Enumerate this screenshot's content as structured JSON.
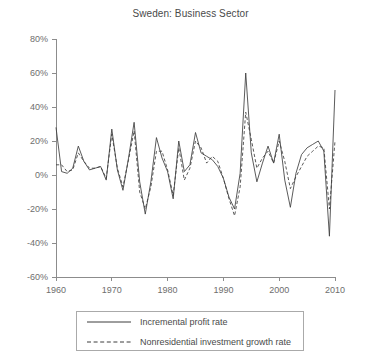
{
  "chart_data": {
    "type": "line",
    "title": "Sweden: Business Sector",
    "xlabel": "",
    "ylabel": "",
    "xlim": [
      1960,
      2010
    ],
    "ylim": [
      -60,
      80
    ],
    "xticks": [
      1960,
      1970,
      1980,
      1990,
      2000,
      2010
    ],
    "xtick_labels": [
      "1960",
      "1970",
      "1980",
      "1990",
      "2000",
      "2010"
    ],
    "yticks": [
      -60,
      -40,
      -20,
      0,
      20,
      40,
      60,
      80
    ],
    "ytick_labels": [
      "-60%",
      "-40%",
      "-20%",
      "0%",
      "20%",
      "40%",
      "60%",
      "80%"
    ],
    "grid": false,
    "legend_position": "below-center",
    "x": [
      1960,
      1961,
      1962,
      1963,
      1964,
      1965,
      1966,
      1967,
      1968,
      1969,
      1970,
      1971,
      1972,
      1973,
      1974,
      1975,
      1976,
      1977,
      1978,
      1979,
      1980,
      1981,
      1982,
      1983,
      1984,
      1985,
      1986,
      1987,
      1988,
      1989,
      1990,
      1991,
      1992,
      1993,
      1994,
      1995,
      1996,
      1997,
      1998,
      1999,
      2000,
      2001,
      2002,
      2003,
      2004,
      2005,
      2006,
      2007,
      2008,
      2009,
      2010
    ],
    "series": [
      {
        "name": "Incremental profit rate",
        "style": "solid",
        "values": [
          28,
          2,
          1,
          4,
          17,
          8,
          3,
          4,
          5,
          -3,
          27,
          3,
          -9,
          10,
          31,
          -4,
          -23,
          -4,
          22,
          10,
          2,
          -14,
          20,
          2,
          6,
          25,
          13,
          11,
          9,
          5,
          -2,
          -13,
          -20,
          1,
          60,
          13,
          -4,
          7,
          17,
          7,
          24,
          -3,
          -19,
          1,
          12,
          16,
          18,
          20,
          14,
          -36,
          50
        ]
      },
      {
        "name": "Nonresidential investment growth rate",
        "style": "dashed",
        "values": [
          6,
          6,
          2,
          3,
          13,
          8,
          4,
          4,
          5,
          -2,
          24,
          4,
          -7,
          9,
          26,
          -10,
          -20,
          -7,
          14,
          14,
          3,
          -12,
          16,
          -3,
          4,
          20,
          16,
          7,
          11,
          8,
          -2,
          -14,
          -24,
          -7,
          37,
          21,
          4,
          10,
          14,
          7,
          20,
          8,
          -8,
          -1,
          5,
          11,
          14,
          17,
          16,
          -20,
          20
        ]
      }
    ]
  },
  "legend": {
    "items": [
      {
        "label": "Incremental profit rate",
        "style": "solid"
      },
      {
        "label": "Nonresidential investment growth rate",
        "style": "dashed"
      }
    ]
  },
  "colors": {
    "series": "#3d3d3d",
    "axis": "#8c8c8c",
    "text": "#4a4a4a",
    "background": "#ffffff"
  }
}
